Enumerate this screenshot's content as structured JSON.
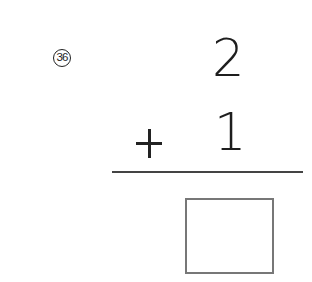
{
  "problem": {
    "number_label": "36",
    "top_operand": "2",
    "operator": "+",
    "bottom_operand": "1",
    "answer": ""
  }
}
